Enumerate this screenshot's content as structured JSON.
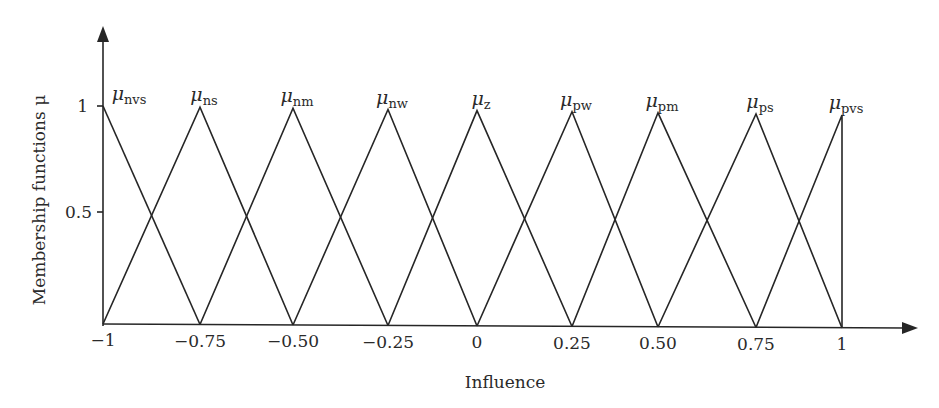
{
  "chart_data": {
    "type": "line",
    "subtype": "triangular membership functions",
    "title": "",
    "xlabel": "Influence",
    "ylabel": "Membership functions μ",
    "xlim": [
      -1,
      1
    ],
    "ylim": [
      0,
      1
    ],
    "grid": false,
    "legend": "none (series labeled at peaks)",
    "x_ticks": [
      -1,
      -0.75,
      -0.5,
      -0.25,
      0,
      0.25,
      0.5,
      0.75,
      1
    ],
    "x_tick_labels": [
      "−1",
      "−0.75",
      "−0.50",
      "−0.25",
      "0",
      "0.25",
      "0.50",
      "0.75",
      "1"
    ],
    "y_ticks": [
      0.5,
      1
    ],
    "y_tick_labels": [
      "0.5",
      "1"
    ],
    "series": [
      {
        "name": "μnvs",
        "symbol": "μ",
        "subscript": "nvs",
        "x": [
          -1,
          -0.75
        ],
        "y": [
          1,
          0
        ]
      },
      {
        "name": "μns",
        "symbol": "μ",
        "subscript": "ns",
        "x": [
          -1,
          -0.75,
          -0.5
        ],
        "y": [
          0,
          1,
          0
        ]
      },
      {
        "name": "μnm",
        "symbol": "μ",
        "subscript": "nm",
        "x": [
          -0.75,
          -0.5,
          -0.25
        ],
        "y": [
          0,
          1,
          0
        ]
      },
      {
        "name": "μnw",
        "symbol": "μ",
        "subscript": "nw",
        "x": [
          -0.5,
          -0.25,
          0
        ],
        "y": [
          0,
          1,
          0
        ]
      },
      {
        "name": "μz",
        "symbol": "μ",
        "subscript": "z",
        "x": [
          -0.25,
          0,
          0.25
        ],
        "y": [
          0,
          1,
          0
        ]
      },
      {
        "name": "μpw",
        "symbol": "μ",
        "subscript": "pw",
        "x": [
          0,
          0.25,
          0.5
        ],
        "y": [
          0,
          1,
          0
        ]
      },
      {
        "name": "μpm",
        "symbol": "μ",
        "subscript": "pm",
        "x": [
          0.25,
          0.5,
          0.75
        ],
        "y": [
          0,
          1,
          0
        ]
      },
      {
        "name": "μps",
        "symbol": "μ",
        "subscript": "ps",
        "x": [
          0.5,
          0.75,
          1
        ],
        "y": [
          0,
          1,
          0
        ]
      },
      {
        "name": "μpvs",
        "symbol": "μ",
        "subscript": "pvs",
        "x": [
          0.75,
          1,
          1
        ],
        "y": [
          0,
          1,
          0
        ]
      }
    ]
  },
  "colors": {
    "line": "#262626",
    "text": "#2a2a2a",
    "background": "#ffffff"
  }
}
